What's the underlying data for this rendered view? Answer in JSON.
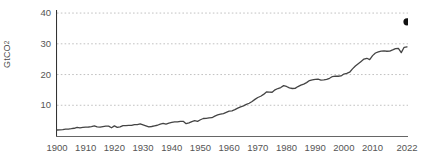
{
  "chart_data": {
    "type": "line",
    "title": "",
    "subtitle": "",
    "xlabel": "",
    "ylabel": "GtCO2",
    "ylabel_display": "GtCO",
    "ylabel_subscript": "2",
    "xlim": [
      1900,
      2022
    ],
    "ylim": [
      0,
      41
    ],
    "grid": true,
    "grid_axis": "y",
    "legend": "none",
    "series_color": "#444444",
    "grid_color": "#bbbbbb",
    "axis_color": "#333333",
    "endpoint_marker": {
      "x": 2022,
      "y": 37.15,
      "shape": "circle",
      "color": "#111111"
    },
    "yticks": [
      10,
      20,
      30,
      40
    ],
    "ytick_labels": [
      "10",
      "20",
      "30",
      "40"
    ],
    "xticks": [
      1900,
      1910,
      1920,
      1930,
      1940,
      1950,
      1960,
      1970,
      1980,
      1990,
      2000,
      2010,
      2022
    ],
    "xtick_labels": [
      "1900",
      "1910",
      "1920",
      "1930",
      "1940",
      "1950",
      "1960",
      "1970",
      "1980",
      "1990",
      "2000",
      "2010",
      "2022"
    ],
    "x": [
      1900,
      1901,
      1902,
      1903,
      1904,
      1905,
      1906,
      1907,
      1908,
      1909,
      1910,
      1911,
      1912,
      1913,
      1914,
      1915,
      1916,
      1917,
      1918,
      1919,
      1920,
      1921,
      1922,
      1923,
      1924,
      1925,
      1926,
      1927,
      1928,
      1929,
      1930,
      1931,
      1932,
      1933,
      1934,
      1935,
      1936,
      1937,
      1938,
      1939,
      1940,
      1941,
      1942,
      1943,
      1944,
      1945,
      1946,
      1947,
      1948,
      1949,
      1950,
      1951,
      1952,
      1953,
      1954,
      1955,
      1956,
      1957,
      1958,
      1959,
      1960,
      1961,
      1962,
      1963,
      1964,
      1965,
      1966,
      1967,
      1968,
      1969,
      1970,
      1971,
      1972,
      1973,
      1974,
      1975,
      1976,
      1977,
      1978,
      1979,
      1980,
      1981,
      1982,
      1983,
      1984,
      1985,
      1986,
      1987,
      1988,
      1989,
      1990,
      1991,
      1992,
      1993,
      1994,
      1995,
      1996,
      1997,
      1998,
      1999,
      2000,
      2001,
      2002,
      2003,
      2004,
      2005,
      2006,
      2007,
      2008,
      2009,
      2010,
      2011,
      2012,
      2013,
      2014,
      2015,
      2016,
      2017,
      2018,
      2019,
      2020,
      2021,
      2022
    ],
    "values": [
      1.95,
      2.01,
      2.07,
      2.25,
      2.26,
      2.38,
      2.52,
      2.8,
      2.66,
      2.78,
      2.91,
      2.93,
      3.07,
      3.28,
      2.94,
      2.87,
      3.07,
      3.21,
      3.21,
      2.69,
      3.28,
      2.79,
      2.94,
      3.37,
      3.39,
      3.46,
      3.43,
      3.71,
      3.7,
      3.94,
      3.62,
      3.29,
      2.94,
      3.09,
      3.32,
      3.5,
      3.84,
      4.09,
      3.86,
      4.19,
      4.4,
      4.57,
      4.58,
      4.79,
      4.78,
      4.01,
      4.25,
      4.68,
      4.97,
      4.77,
      5.28,
      5.69,
      5.74,
      5.87,
      5.95,
      6.47,
      6.86,
      7.09,
      7.31,
      7.71,
      8.12,
      8.2,
      8.56,
      9.05,
      9.47,
      9.8,
      10.3,
      10.66,
      11.25,
      11.91,
      12.52,
      12.94,
      13.54,
      14.34,
      14.25,
      14.24,
      15.03,
      15.45,
      15.76,
      16.38,
      16.12,
      15.65,
      15.46,
      15.5,
      16.09,
      16.54,
      16.88,
      17.36,
      18.03,
      18.28,
      18.4,
      18.47,
      18.2,
      18.24,
      18.4,
      18.78,
      19.34,
      19.49,
      19.44,
      19.54,
      20.16,
      20.38,
      20.76,
      21.84,
      22.78,
      23.54,
      24.27,
      25.03,
      25.29,
      24.88,
      26.16,
      27.01,
      27.35,
      27.62,
      27.68,
      27.58,
      27.62,
      28.0,
      28.41,
      28.54,
      27.12,
      28.86,
      29.02
    ]
  }
}
